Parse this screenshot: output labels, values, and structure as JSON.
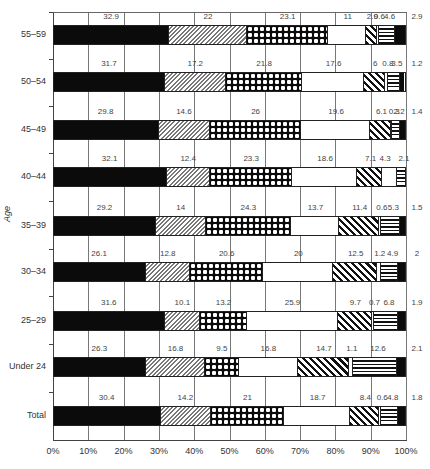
{
  "chart_data": {
    "type": "bar",
    "orientation": "horizontal",
    "stacked": true,
    "percent": true,
    "title": "",
    "xlabel": "",
    "ylabel": "Age",
    "xlim": [
      0,
      100
    ],
    "x_ticks": [
      "0%",
      "10%",
      "20%",
      "30%",
      "40%",
      "50%",
      "60%",
      "70%",
      "80%",
      "90%",
      "100%"
    ],
    "grid": true,
    "legend": null,
    "categories": [
      "55–59",
      "50–54",
      "45–49",
      "40–44",
      "35–39",
      "30–34",
      "25–29",
      "Under 24",
      "Total"
    ],
    "series": [
      {
        "name": "Segment 1 (solid black)",
        "pattern": "solid-black",
        "values": [
          32.9,
          31.7,
          29.8,
          32.1,
          29.2,
          26.1,
          31.6,
          26.3,
          30.4
        ]
      },
      {
        "name": "Segment 2 (fine diagonal hatch)",
        "pattern": "fine-hatch",
        "values": [
          22,
          17.2,
          14.6,
          12.4,
          14,
          12.8,
          10.1,
          16.8,
          14.2
        ]
      },
      {
        "name": "Segment 3 (black with white dots)",
        "pattern": "dotted-black",
        "values": [
          23.1,
          21.8,
          26,
          23.3,
          24.3,
          20.6,
          13.2,
          9.5,
          21
        ]
      },
      {
        "name": "Segment 4 (white)",
        "pattern": "white",
        "values": [
          11,
          17.6,
          19.6,
          18.6,
          13.7,
          20,
          25.9,
          16.8,
          18.7
        ]
      },
      {
        "name": "Segment 5 (bold diagonal stripes)",
        "pattern": "bold-diagonal",
        "values": [
          2.9,
          6,
          6.1,
          7.1,
          11.4,
          12.5,
          9.7,
          14.7,
          8.4
        ]
      },
      {
        "name": "Segment 6 (thin white)",
        "pattern": "thin-white",
        "values": [
          0.6,
          0.8,
          0.3,
          4.3,
          0.6,
          1.2,
          0.7,
          1.1,
          0.6
        ]
      },
      {
        "name": "Segment 7 (horizontal stripes)",
        "pattern": "horizontal-stripes",
        "values": [
          4.6,
          3.5,
          2.2,
          2.1,
          5.3,
          4.9,
          6.8,
          12.6,
          4.8
        ]
      },
      {
        "name": "Segment 8 (solid black end)",
        "pattern": "solid-black",
        "values": [
          2.9,
          1.2,
          1.4,
          0,
          1.5,
          2,
          1.9,
          2.1,
          1.8
        ]
      }
    ]
  },
  "rows": [
    {
      "label": "55–59",
      "labels": [
        "32.9",
        "22",
        "23.1",
        "11",
        "2.9",
        "0.6",
        "4.6",
        "2.9"
      ]
    },
    {
      "label": "50–54",
      "labels": [
        "31.7",
        "17.2",
        "21.8",
        "17.6",
        "6",
        "0.8",
        "3.5",
        "1.2"
      ]
    },
    {
      "label": "45–49",
      "labels": [
        "29.8",
        "14.6",
        "26",
        "19.6",
        "6.1",
        "0.3",
        "2.2",
        "1.4"
      ]
    },
    {
      "label": "40–44",
      "labels": [
        "32.1",
        "12.4",
        "23.3",
        "18.6",
        "7.1",
        "4.3",
        "2.1",
        ""
      ]
    },
    {
      "label": "35–39",
      "labels": [
        "29.2",
        "14",
        "24.3",
        "13.7",
        "11.4",
        "0.6",
        "5.3",
        "1.5"
      ]
    },
    {
      "label": "30–34",
      "labels": [
        "26.1",
        "12.8",
        "20.6",
        "20",
        "12.5",
        "1.2",
        "4.9",
        "2"
      ]
    },
    {
      "label": "25–29",
      "labels": [
        "31.6",
        "10.1",
        "13.2",
        "25.9",
        "9.7",
        "0.7",
        "6.8",
        "1.9"
      ]
    },
    {
      "label": "Under 24",
      "labels": [
        "26.3",
        "16.8",
        "9.5",
        "16.8",
        "14.7",
        "1.1",
        "12.6",
        "2.1"
      ]
    },
    {
      "label": "Total",
      "labels": [
        "30.4",
        "14.2",
        "21",
        "18.7",
        "8.4",
        "0.6",
        "4.8",
        "1.8"
      ]
    }
  ],
  "axis": {
    "y_title": "Age"
  }
}
